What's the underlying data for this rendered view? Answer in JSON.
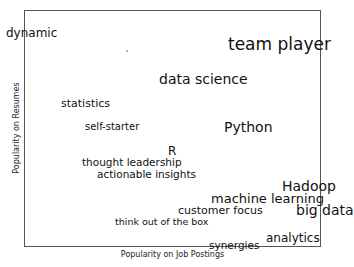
{
  "chart_data": {
    "type": "scatter",
    "subtype": "text-label scatter (word positions)",
    "title": "",
    "xlabel": "Popularity on Job Postings",
    "ylabel": "Popularity on Resumes",
    "xlim": [
      0,
      1
    ],
    "ylim": [
      0,
      1
    ],
    "ticks": "none",
    "grid": false,
    "legend": "none",
    "points": [
      {
        "label": "dynamic",
        "x": -0.06,
        "y": 0.91,
        "size": 12
      },
      {
        "label": "team player",
        "x": 0.69,
        "y": 0.85,
        "size": 17
      },
      {
        "label": "data science",
        "x": 0.45,
        "y": 0.7,
        "size": 14
      },
      {
        "label": "statistics",
        "x": 0.12,
        "y": 0.6,
        "size": 11
      },
      {
        "label": "self-starter",
        "x": 0.2,
        "y": 0.5,
        "size": 10
      },
      {
        "label": "Python",
        "x": 0.67,
        "y": 0.5,
        "size": 14
      },
      {
        "label": "R",
        "x": 0.48,
        "y": 0.4,
        "size": 12
      },
      {
        "label": "thought leadership",
        "x": 0.2,
        "y": 0.35,
        "size": 10.5
      },
      {
        "label": "actionable insights",
        "x": 0.25,
        "y": 0.3,
        "size": 10.5
      },
      {
        "label": "Hadoop",
        "x": 0.87,
        "y": 0.26,
        "size": 14
      },
      {
        "label": "machine learning",
        "x": 0.63,
        "y": 0.2,
        "size": 13
      },
      {
        "label": "customer focus",
        "x": 0.52,
        "y": 0.15,
        "size": 11
      },
      {
        "label": "big data",
        "x": 0.92,
        "y": 0.15,
        "size": 14
      },
      {
        "label": "think out of the box",
        "x": 0.31,
        "y": 0.1,
        "size": 9.5
      },
      {
        "label": "analytics",
        "x": 0.81,
        "y": 0.03,
        "size": 12
      },
      {
        "label": "synergies",
        "x": 0.62,
        "y": -0.01,
        "size": 10.5
      }
    ]
  },
  "labels": {
    "words": [
      {
        "text": "dynamic",
        "left": 6,
        "top": 27,
        "size": 12
      },
      {
        "text": "team player",
        "left": 228,
        "top": 36,
        "size": 17
      },
      {
        "text": "data science",
        "left": 159,
        "top": 72,
        "size": 14
      },
      {
        "text": "statistics",
        "left": 61,
        "top": 98,
        "size": 11
      },
      {
        "text": "self-starter",
        "left": 85,
        "top": 122,
        "size": 10
      },
      {
        "text": "Python",
        "left": 224,
        "top": 120,
        "size": 14
      },
      {
        "text": "R",
        "left": 168,
        "top": 145,
        "size": 12
      },
      {
        "text": "thought leadership",
        "left": 82,
        "top": 157,
        "size": 10.5
      },
      {
        "text": "actionable insights",
        "left": 97,
        "top": 169,
        "size": 10.5
      },
      {
        "text": "Hadoop",
        "left": 282,
        "top": 179,
        "size": 14
      },
      {
        "text": "machine learning",
        "left": 211,
        "top": 192,
        "size": 13
      },
      {
        "text": "customer focus",
        "left": 178,
        "top": 205,
        "size": 11
      },
      {
        "text": "big data",
        "left": 296,
        "top": 203,
        "size": 14
      },
      {
        "text": "think out of the box",
        "left": 115,
        "top": 217,
        "size": 9.5
      },
      {
        "text": "analytics",
        "left": 266,
        "top": 232,
        "size": 12
      },
      {
        "text": "synergies",
        "left": 209,
        "top": 240,
        "size": 10.5
      }
    ],
    "xlabel": "Popularity on Job Postings",
    "ylabel": "Popularity on Resumes"
  }
}
